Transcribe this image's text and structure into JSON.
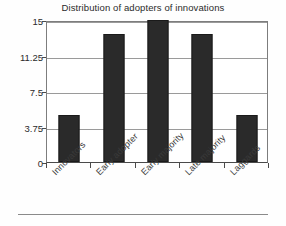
{
  "chart_data": {
    "type": "bar",
    "title": "Distribution of adopters of innovations",
    "xlabel": "",
    "ylabel": "",
    "categories": [
      "Innovators",
      "Early adopter",
      "Early majority",
      "Late majority",
      "Laggards"
    ],
    "values": [
      5,
      13.5,
      15,
      13.5,
      5
    ],
    "series": [
      {
        "name": "Adopters",
        "values": [
          5,
          13.5,
          15,
          13.5,
          5
        ]
      }
    ],
    "ylim": [
      0,
      15
    ],
    "yticks": [
      0,
      3.75,
      7.5,
      11.25,
      15
    ],
    "ytick_labels": [
      "0",
      "3.75",
      "7.5",
      "11.25",
      "15"
    ],
    "grid": true,
    "grid_axis": "y",
    "legend": false,
    "legend_position": "none",
    "bar_color": "#2a2a2a",
    "plot_background": "#ffffff",
    "axis_color": "#4a4a4a",
    "gridline_color": "#9a9a9a",
    "xtick_label_rotation": -45
  }
}
